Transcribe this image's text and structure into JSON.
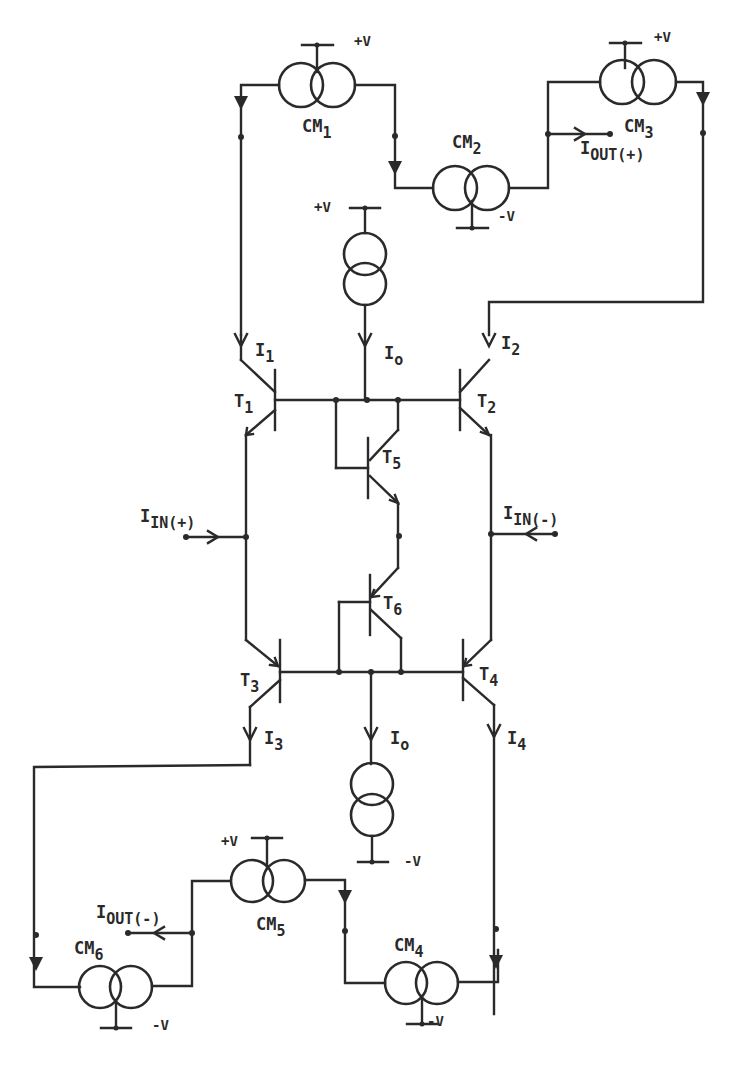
{
  "diagram": {
    "title": "",
    "type": "circuit-schematic",
    "stroke_color": "#2a2a2a",
    "background": "#ffffff",
    "current_mirrors": [
      {
        "id": "CM1",
        "label_main": "CM",
        "label_sub": "1",
        "supply": "+V"
      },
      {
        "id": "CM2",
        "label_main": "CM",
        "label_sub": "2",
        "supply": "-V"
      },
      {
        "id": "CM3",
        "label_main": "CM",
        "label_sub": "3",
        "supply": "+V"
      },
      {
        "id": "CM4",
        "label_main": "CM",
        "label_sub": "4",
        "supply": "-V"
      },
      {
        "id": "CM5",
        "label_main": "CM",
        "label_sub": "5",
        "supply": "+V"
      },
      {
        "id": "CM6",
        "label_main": "CM",
        "label_sub": "6",
        "supply": "-V"
      }
    ],
    "current_sources": [
      {
        "id": "top-source",
        "supply": "+V",
        "current_main": "I",
        "current_sub": "o"
      },
      {
        "id": "bottom-source",
        "supply": "-V",
        "current_main": "I",
        "current_sub": "o"
      }
    ],
    "transistors": [
      {
        "id": "T1",
        "label_main": "T",
        "label_sub": "1"
      },
      {
        "id": "T2",
        "label_main": "T",
        "label_sub": "2"
      },
      {
        "id": "T3",
        "label_main": "T",
        "label_sub": "3"
      },
      {
        "id": "T4",
        "label_main": "T",
        "label_sub": "4"
      },
      {
        "id": "T5",
        "label_main": "T",
        "label_sub": "5"
      },
      {
        "id": "T6",
        "label_main": "T",
        "label_sub": "6"
      }
    ],
    "currents": [
      {
        "id": "I1",
        "main": "I",
        "sub": "1"
      },
      {
        "id": "I2",
        "main": "I",
        "sub": "2"
      },
      {
        "id": "I3",
        "main": "I",
        "sub": "3"
      },
      {
        "id": "I4",
        "main": "I",
        "sub": "4"
      }
    ],
    "ports": [
      {
        "id": "iin-plus",
        "main": "I",
        "sub": "IN(+)"
      },
      {
        "id": "iin-minus",
        "main": "I",
        "sub": "IN(-)"
      },
      {
        "id": "iout-plus",
        "main": "I",
        "sub": "OUT(+)"
      },
      {
        "id": "iout-minus",
        "main": "I",
        "sub": "OUT(-)"
      }
    ]
  }
}
